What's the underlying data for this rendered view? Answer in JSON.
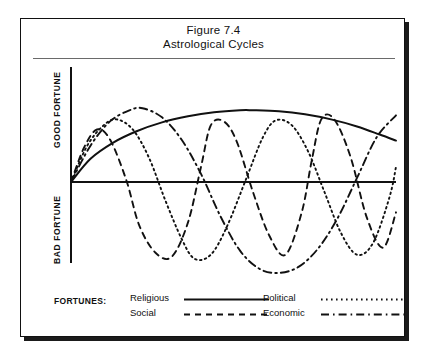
{
  "figure": {
    "title_line1": "Figure 7.4",
    "title_line2": "Astrological Cycles",
    "axis_label_top": "GOOD FORTUNE",
    "axis_label_bottom": "BAD FORTUNE",
    "legend_title": "FORTUNES:"
  },
  "chart_data": {
    "type": "line",
    "title": "Astrological Cycles",
    "subtitle": "Figure 7.4",
    "xlabel": "",
    "ylabel": "",
    "grid": false,
    "legend_position": "bottom",
    "axis_style": "origin-cross",
    "xlim": [
      0,
      10
    ],
    "ylim": [
      -10,
      10
    ],
    "y_axis_regions": [
      {
        "label": "GOOD FORTUNE",
        "range": [
          0,
          10
        ]
      },
      {
        "label": "BAD FORTUNE",
        "range": [
          -10,
          0
        ]
      }
    ],
    "series": [
      {
        "name": "Religious",
        "style": "solid",
        "color": "#111111",
        "description": "Single very long slow arc, rises from origin, peaks near x=5.6, declines gently to the right edge",
        "x": [
          0,
          0.6,
          1.3,
          2.0,
          2.8,
          3.6,
          4.4,
          5.2,
          5.6,
          6.4,
          7.2,
          8.0,
          8.8,
          9.5,
          10
        ],
        "y": [
          0,
          2.3,
          3.9,
          5.0,
          5.9,
          6.5,
          6.9,
          7.1,
          7.1,
          7.0,
          6.7,
          6.2,
          5.5,
          4.7,
          4.1
        ]
      },
      {
        "name": "Social",
        "style": "dashed",
        "color": "#111111",
        "description": "Short period cycle, about 3 peaks across the plot, peaks near x=0.8, x=4.3, x=7.7",
        "x": [
          0,
          0.4,
          0.8,
          1.2,
          1.7,
          2.1,
          2.6,
          3.1,
          3.6,
          4.0,
          4.3,
          4.7,
          5.1,
          5.6,
          6.1,
          6.6,
          7.1,
          7.4,
          7.7,
          8.1,
          8.6,
          9.1,
          9.6,
          10
        ],
        "y": [
          0,
          3.4,
          5.2,
          4.2,
          0.2,
          -4.3,
          -7.0,
          -7.4,
          -4.0,
          1.5,
          5.6,
          6.0,
          4.0,
          -1.0,
          -5.3,
          -7.2,
          -3.0,
          2.0,
          6.2,
          6.2,
          2.5,
          -3.5,
          -6.5,
          -3.0
        ]
      },
      {
        "name": "Political",
        "style": "dotted",
        "color": "#111111",
        "description": "Medium period cycle, peaks near x=1.4 and x=6.3, deep troughs near x=3.8 and x=8.8",
        "x": [
          0,
          0.5,
          1.0,
          1.4,
          1.9,
          2.4,
          2.9,
          3.4,
          3.8,
          4.3,
          4.8,
          5.4,
          5.9,
          6.3,
          6.8,
          7.3,
          7.8,
          8.3,
          8.8,
          9.3,
          9.8,
          10
        ],
        "y": [
          0,
          3.6,
          5.6,
          6.2,
          5.2,
          2.4,
          -1.8,
          -5.6,
          -7.6,
          -7.2,
          -4.4,
          0.4,
          4.4,
          6.1,
          5.6,
          3.0,
          -1.0,
          -5.0,
          -7.2,
          -6.0,
          -1.5,
          1.5
        ]
      },
      {
        "name": "Economic",
        "style": "dash-dot",
        "color": "#111111",
        "description": "Longest of the cyclical series, broad peak near x=2.2, deepest trough near x=6.4, rising at right edge",
        "x": [
          0,
          0.6,
          1.2,
          1.8,
          2.2,
          2.8,
          3.4,
          4.0,
          4.6,
          5.2,
          5.8,
          6.4,
          7.0,
          7.6,
          8.2,
          8.8,
          9.4,
          10
        ],
        "y": [
          0,
          3.6,
          6.0,
          7.1,
          7.3,
          6.4,
          4.2,
          0.8,
          -3.4,
          -6.8,
          -8.6,
          -9.0,
          -8.4,
          -6.6,
          -3.6,
          0.4,
          4.4,
          6.6
        ]
      }
    ],
    "legend": [
      {
        "label": "Religious",
        "style": "solid"
      },
      {
        "label": "Social",
        "style": "dashed"
      },
      {
        "label": "Political",
        "style": "dotted"
      },
      {
        "label": "Economic",
        "style": "dash-dot"
      }
    ]
  }
}
